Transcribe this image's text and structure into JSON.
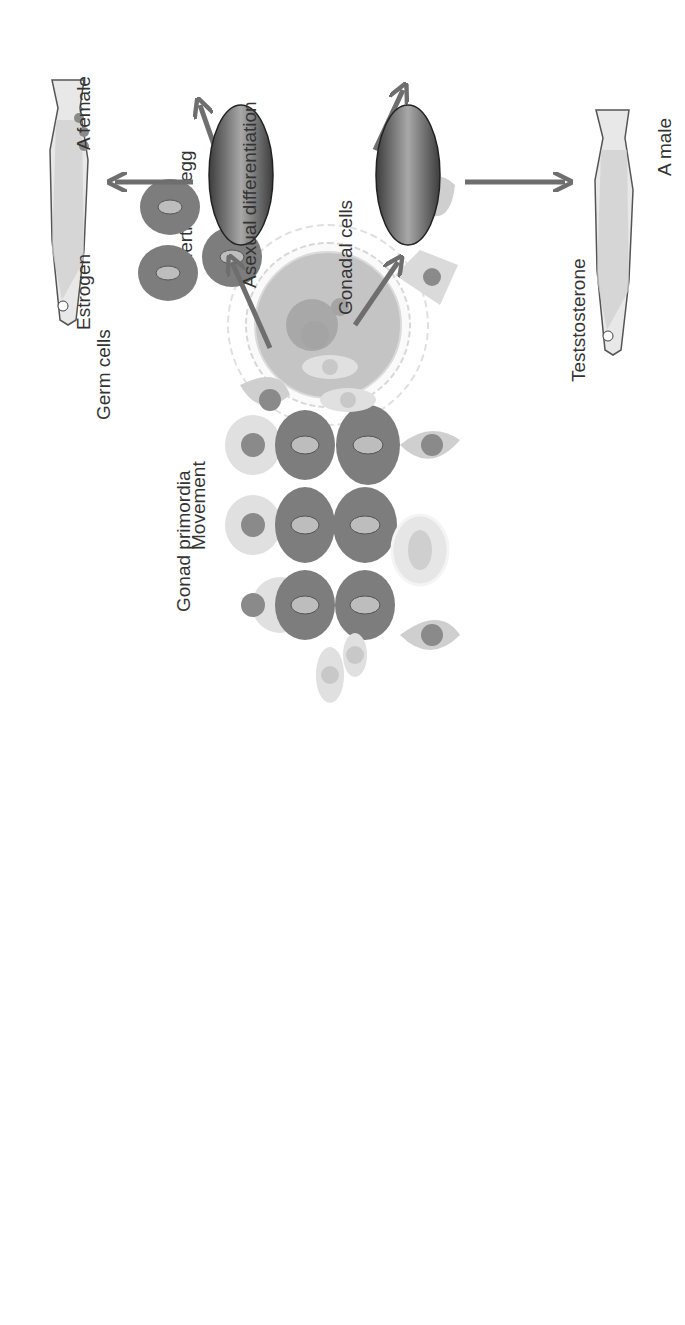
{
  "diagram": {
    "orientation": "rotated-90-ccw",
    "colors": {
      "background": "#ffffff",
      "arrow": "#6e6e6e",
      "germ_cell": "#7d7d7d",
      "germ_nucleus": "#bdbdbd",
      "gonadal_cell": "#cfcfcf",
      "gonadal_nucleus": "#8a8a8a",
      "oval_cell": "#dcdcdc",
      "egg": "#bfbfbf",
      "text": "#333333"
    },
    "labels": {
      "egg": "A fertilized egg",
      "germ_cells": "Germ cells",
      "gonadal_cells": "Gonadal cells",
      "movement": "Movement",
      "gonad_primordia": "Gonad primordia",
      "estrogen": "Estrogen",
      "asexual": "Asexual differentiation",
      "female": "A female",
      "testosterone": "Teststosterone",
      "male": "A male"
    }
  }
}
